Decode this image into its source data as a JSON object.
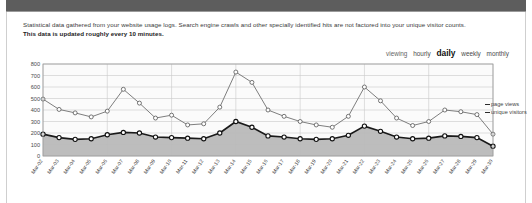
{
  "header": {
    "bar_color": "#5d5d5d"
  },
  "intro": {
    "line1": "Statistical data gathered from your website usage logs. Search engine crawls and other specially identified hits are not factored into your unique visitor counts.",
    "line2": "This data is updated roughly every 10 minutes."
  },
  "viewing_nav": {
    "label": "viewing",
    "options": [
      {
        "label": "hourly",
        "active": false
      },
      {
        "label": "daily",
        "active": true
      },
      {
        "label": "weekly",
        "active": false
      },
      {
        "label": "monthly",
        "active": false
      }
    ]
  },
  "legend": {
    "page_views": "page views",
    "unique_visitors": "unique visitors"
  },
  "chart_data": {
    "type": "line",
    "title": "",
    "xlabel": "",
    "ylabel": "",
    "ylim": [
      0,
      800
    ],
    "ytick_step": 100,
    "yticks": [
      "0",
      "100",
      "200",
      "300",
      "400",
      "500",
      "600",
      "700",
      "800"
    ],
    "grid": true,
    "legend_position": "right",
    "area_fill_series": "unique visitors",
    "area_fill_color": "#b9b9b9",
    "line_color_page_views": "#6f6f6f",
    "line_color_unique_visitors": "#1a1a1a",
    "marker": "circle-open-white",
    "categories": [
      "Mar-02",
      "Mar-03",
      "Mar-04",
      "Mar-05",
      "Mar-06",
      "Mar-07",
      "Mar-08",
      "Mar-09",
      "Mar-10",
      "Mar-11",
      "Mar-12",
      "Mar-13",
      "Mar-14",
      "Mar-15",
      "Mar-16",
      "Mar-17",
      "Mar-18",
      "Mar-19",
      "Mar-20",
      "Mar-21",
      "Mar-22",
      "Mar-23",
      "Mar-24",
      "Mar-25",
      "Mar-26",
      "Mar-27",
      "Mar-28",
      "Mar-29",
      "Mar-30"
    ],
    "series": [
      {
        "name": "page views",
        "values": [
          495,
          405,
          375,
          340,
          390,
          580,
          460,
          330,
          355,
          270,
          280,
          425,
          730,
          640,
          400,
          345,
          300,
          270,
          250,
          345,
          600,
          480,
          330,
          265,
          300,
          400,
          385,
          360,
          190
        ]
      },
      {
        "name": "unique visitors",
        "values": [
          190,
          160,
          145,
          150,
          185,
          205,
          200,
          165,
          160,
          155,
          150,
          200,
          300,
          250,
          175,
          165,
          150,
          145,
          150,
          180,
          260,
          215,
          165,
          150,
          155,
          175,
          170,
          160,
          85
        ]
      }
    ]
  }
}
